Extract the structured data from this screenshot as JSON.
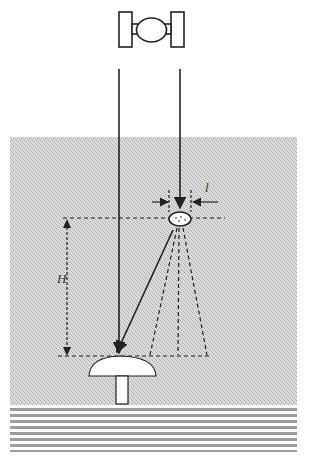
{
  "diagram": {
    "labels": {
      "height": "H",
      "width": "l"
    },
    "elements": [
      {
        "name": "satellite",
        "icon": "satellite-icon"
      },
      {
        "name": "incident-beam-left"
      },
      {
        "name": "incident-beam-right"
      },
      {
        "name": "water-body",
        "fill": "#d4d4d4"
      },
      {
        "name": "target-ellipse"
      },
      {
        "name": "scatter-cone"
      },
      {
        "name": "mushroom-reflector"
      },
      {
        "name": "seabed-stripes"
      }
    ],
    "colors": {
      "line": "#222222",
      "water": "#d6d6d6",
      "stripe": "#9a9a9a"
    }
  }
}
